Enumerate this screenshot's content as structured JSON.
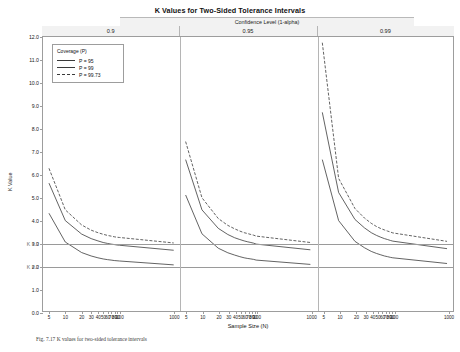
{
  "title": "K Values for Two-Sided Tolerance Intervals",
  "conf_band_label": "Confidence Level (1-alpha)",
  "groups": [
    {
      "label": "0.9"
    },
    {
      "label": "0.95"
    },
    {
      "label": "0.99"
    }
  ],
  "legend": {
    "title": "Coverage (P)",
    "items": [
      {
        "label": "P = 95",
        "color": "#3a3a3a",
        "dash": "none"
      },
      {
        "label": "P = 99",
        "color": "#3a3a3a",
        "dash": "none"
      },
      {
        "label": "P = 99.73",
        "color": "#3a3a3a",
        "dash": "dashed"
      }
    ]
  },
  "caption": "Fig. 7.17  K values for two-sided tolerance intervals",
  "chart_data": {
    "type": "line",
    "title": "K Values for Two-Sided Tolerance Intervals",
    "xlabel": "Sample Size (N)",
    "ylabel": "K Value",
    "ylim": [
      0.0,
      12.0
    ],
    "yticks": [
      0.0,
      1.0,
      2.0,
      3.0,
      4.0,
      5.0,
      6.0,
      7.0,
      8.0,
      9.0,
      10.0,
      11.0,
      12.0
    ],
    "ytick_labels": [
      "0.0",
      "1.0",
      "2.0",
      "3.0",
      "4.0",
      "5.0",
      "6.0",
      "7.0",
      "8.0",
      "9.0",
      "10.0",
      "11.0",
      "12.0"
    ],
    "reference_lines": [
      {
        "value": 3.0,
        "label": "K = 3"
      },
      {
        "value": 2.0,
        "label": "K = 2"
      }
    ],
    "xticks": [
      5,
      10,
      20,
      30,
      40,
      50,
      60,
      70,
      80,
      90,
      100,
      1000
    ],
    "xtick_labels": [
      "5",
      "10",
      "20",
      "30",
      "40",
      "50",
      "60",
      "70",
      "80",
      "90",
      "100",
      "1000"
    ],
    "grid": false,
    "legend_position": "top-left",
    "panels": [
      {
        "confidence": "0.9",
        "series": [
          {
            "name": "P = 95",
            "x": [
              5,
              10,
              20,
              30,
              40,
              50,
              60,
              70,
              80,
              90,
              100,
              1000
            ],
            "values": [
              4.28,
              3.02,
              2.56,
              2.41,
              2.33,
              2.28,
              2.25,
              2.23,
              2.21,
              2.2,
              2.19,
              2.02
            ]
          },
          {
            "name": "P = 99",
            "x": [
              5,
              10,
              20,
              30,
              40,
              50,
              60,
              70,
              80,
              90,
              100,
              1000
            ],
            "values": [
              5.6,
              3.96,
              3.37,
              3.17,
              3.07,
              3.0,
              2.96,
              2.93,
              2.91,
              2.89,
              2.88,
              2.66
            ]
          },
          {
            "name": "P = 99.73",
            "x": [
              5,
              10,
              20,
              30,
              40,
              50,
              60,
              70,
              80,
              90,
              100,
              1000
            ],
            "values": [
              6.25,
              4.43,
              3.77,
              3.54,
              3.43,
              3.36,
              3.31,
              3.28,
              3.25,
              3.23,
              3.22,
              2.98
            ]
          }
        ]
      },
      {
        "confidence": "0.95",
        "series": [
          {
            "name": "P = 95",
            "x": [
              5,
              10,
              20,
              30,
              40,
              50,
              60,
              70,
              80,
              90,
              100,
              1000
            ],
            "values": [
              5.08,
              3.38,
              2.75,
              2.55,
              2.45,
              2.38,
              2.33,
              2.3,
              2.28,
              2.26,
              2.23,
              2.04
            ]
          },
          {
            "name": "P = 99",
            "x": [
              5,
              10,
              20,
              30,
              40,
              50,
              60,
              70,
              80,
              90,
              100,
              1000
            ],
            "values": [
              6.63,
              4.43,
              3.62,
              3.35,
              3.21,
              3.13,
              3.07,
              3.03,
              3.0,
              2.97,
              2.93,
              2.68
            ]
          },
          {
            "name": "P = 99.73",
            "x": [
              5,
              10,
              20,
              30,
              40,
              50,
              60,
              70,
              80,
              90,
              100,
              1000
            ],
            "values": [
              7.42,
              4.96,
              4.05,
              3.75,
              3.6,
              3.5,
              3.43,
              3.39,
              3.35,
              3.32,
              3.28,
              3.0
            ]
          }
        ]
      },
      {
        "confidence": "0.99",
        "series": [
          {
            "name": "P = 95",
            "x": [
              5,
              10,
              20,
              30,
              40,
              50,
              60,
              70,
              80,
              90,
              100,
              1000
            ],
            "values": [
              6.63,
              3.96,
              3.05,
              2.77,
              2.61,
              2.52,
              2.46,
              2.41,
              2.38,
              2.35,
              2.33,
              2.08
            ]
          },
          {
            "name": "P = 99",
            "x": [
              5,
              10,
              20,
              30,
              40,
              50,
              60,
              70,
              80,
              90,
              100,
              1000
            ],
            "values": [
              8.7,
              5.19,
              4.01,
              3.64,
              3.43,
              3.31,
              3.23,
              3.17,
              3.13,
              3.09,
              3.06,
              2.73
            ]
          },
          {
            "name": "P = 99.73",
            "x": [
              5,
              10,
              20,
              30,
              40,
              50,
              60,
              70,
              80,
              90,
              100,
              1000
            ],
            "values": [
              11.75,
              5.81,
              4.49,
              4.07,
              3.84,
              3.7,
              3.61,
              3.55,
              3.5,
              3.46,
              3.42,
              3.05
            ]
          }
        ]
      }
    ]
  }
}
